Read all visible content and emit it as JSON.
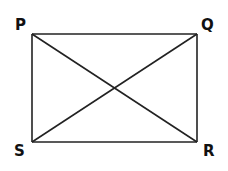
{
  "diagram": {
    "title": "",
    "shape": "rectangle",
    "stroke_color": "#222222",
    "vertices": [
      {
        "label": "P",
        "x": 32,
        "y": 34
      },
      {
        "label": "Q",
        "x": 197,
        "y": 34
      },
      {
        "label": "R",
        "x": 197,
        "y": 142
      },
      {
        "label": "S",
        "x": 32,
        "y": 142
      }
    ],
    "edges": [
      [
        "P",
        "Q"
      ],
      [
        "Q",
        "R"
      ],
      [
        "R",
        "S"
      ],
      [
        "S",
        "P"
      ]
    ],
    "diagonals": [
      [
        "P",
        "R"
      ],
      [
        "Q",
        "S"
      ]
    ],
    "labels": {
      "P": "P",
      "Q": "Q",
      "R": "R",
      "S": "S"
    }
  }
}
